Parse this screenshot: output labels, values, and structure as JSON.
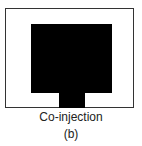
{
  "figure": {
    "caption": "Co-injection",
    "panel_label": "(b)",
    "colors": {
      "frame_border": "#333333",
      "fill": "#000000",
      "background": "#ffffff"
    }
  }
}
